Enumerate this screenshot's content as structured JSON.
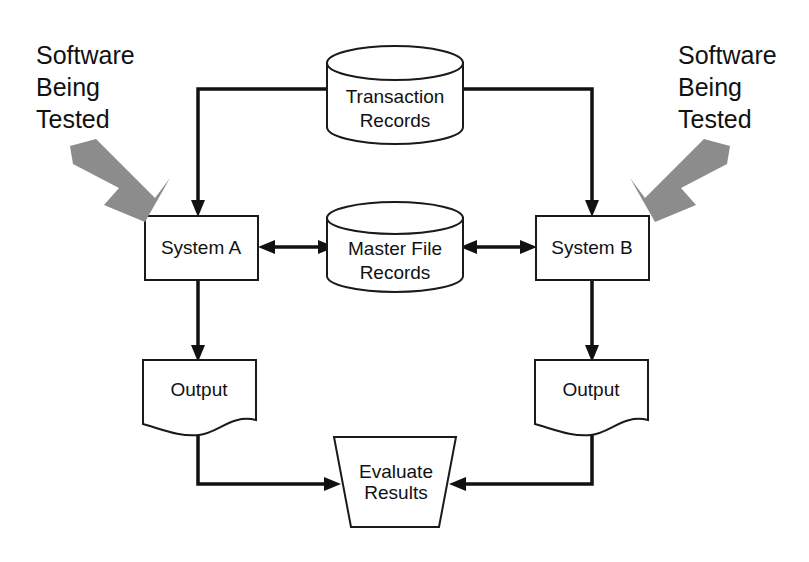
{
  "diagram": {
    "background_color": "#ffffff",
    "line_color": "#111111",
    "shape_stroke_color": "#1a1a1a",
    "annotation_arrow_color": "#8c8c8c",
    "annotations": [
      {
        "id": "annotation-left",
        "lines": [
          "Software",
          "Being",
          "Tested"
        ],
        "points_to": "System A"
      },
      {
        "id": "annotation-right",
        "lines": [
          "Software",
          "Being",
          "Tested"
        ],
        "points_to": "System B"
      }
    ],
    "nodes": [
      {
        "id": "transaction-records",
        "shape": "cylinder",
        "lines": [
          "Transaction",
          "Records"
        ]
      },
      {
        "id": "master-file-records",
        "shape": "cylinder",
        "lines": [
          "Master File",
          "Records"
        ]
      },
      {
        "id": "system-a",
        "shape": "rectangle",
        "lines": [
          "System A"
        ]
      },
      {
        "id": "system-b",
        "shape": "rectangle",
        "lines": [
          "System B"
        ]
      },
      {
        "id": "output-a",
        "shape": "document",
        "lines": [
          "Output"
        ]
      },
      {
        "id": "output-b",
        "shape": "document",
        "lines": [
          "Output"
        ]
      },
      {
        "id": "evaluate-results",
        "shape": "trapezoid",
        "lines": [
          "Evaluate",
          "Results"
        ]
      }
    ],
    "edges": [
      {
        "id": "edge-transactions-to-system-a",
        "from": "transaction-records",
        "to": "system-a",
        "direction": "one-way"
      },
      {
        "id": "edge-transactions-to-system-b",
        "from": "transaction-records",
        "to": "system-b",
        "direction": "one-way"
      },
      {
        "id": "edge-system-a-master-file",
        "from": "system-a",
        "to": "master-file-records",
        "direction": "two-way"
      },
      {
        "id": "edge-system-b-master-file",
        "from": "system-b",
        "to": "master-file-records",
        "direction": "two-way"
      },
      {
        "id": "edge-system-a-to-output-a",
        "from": "system-a",
        "to": "output-a",
        "direction": "one-way"
      },
      {
        "id": "edge-system-b-to-output-b",
        "from": "system-b",
        "to": "output-b",
        "direction": "one-way"
      },
      {
        "id": "edge-output-a-to-evaluate",
        "from": "output-a",
        "to": "evaluate-results",
        "direction": "one-way"
      },
      {
        "id": "edge-output-b-to-evaluate",
        "from": "output-b",
        "to": "evaluate-results",
        "direction": "one-way"
      }
    ]
  }
}
